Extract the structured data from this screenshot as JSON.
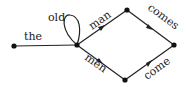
{
  "diagram": {
    "type": "word lattice / finite-state graph",
    "nodes": [
      "start",
      "hub",
      "top",
      "bottom",
      "end"
    ],
    "edges": [
      {
        "from": "start",
        "to": "hub",
        "label": "the"
      },
      {
        "from": "hub",
        "to": "hub",
        "label": "old",
        "self_loop": true
      },
      {
        "from": "hub",
        "to": "top",
        "label": "man"
      },
      {
        "from": "hub",
        "to": "bottom",
        "label": "men"
      },
      {
        "from": "top",
        "to": "end",
        "label": "comes"
      },
      {
        "from": "bottom",
        "to": "end",
        "label": "come"
      }
    ],
    "colors": {
      "line": "#222222",
      "node": "#111111"
    }
  }
}
